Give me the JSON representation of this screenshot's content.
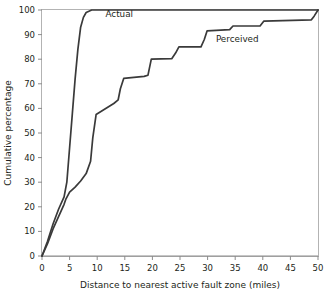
{
  "chart_data": {
    "type": "line",
    "title": "",
    "xlabel": "Distance to nearest active fault zone (miles)",
    "ylabel": "Cumulative percentage",
    "xlim": [
      0,
      50
    ],
    "ylim": [
      0,
      100
    ],
    "xticks": [
      0,
      5,
      10,
      15,
      20,
      25,
      30,
      35,
      40,
      45,
      50
    ],
    "yticks": [
      0,
      10,
      20,
      30,
      40,
      50,
      60,
      70,
      80,
      90,
      100
    ],
    "xtick_labels": [
      "0",
      "5",
      "10",
      "15",
      "20",
      "25",
      "30",
      "35",
      "40",
      "45",
      "50"
    ],
    "ytick_labels": [
      "0",
      "10",
      "20",
      "30",
      "40",
      "50",
      "60",
      "70",
      "80",
      "90",
      "100"
    ],
    "grid": false,
    "legend_position": "inline-annotations",
    "line_color": "#3a3a3a",
    "frame_color": "#b3b3b3",
    "series": [
      {
        "name": "Actual",
        "label_x": 11.5,
        "label_y": 97,
        "x": [
          0,
          1,
          2,
          3,
          4,
          4.5,
          5,
          5.5,
          6,
          6.5,
          7,
          7.5,
          8,
          9,
          12,
          20,
          30,
          40,
          50
        ],
        "values": [
          0,
          6,
          13,
          19,
          24,
          30,
          44,
          58,
          72,
          84,
          93,
          97,
          99,
          100,
          100,
          100,
          100,
          100,
          100
        ]
      },
      {
        "name": "Perceived",
        "label_x": 31.5,
        "label_y": 87,
        "x": [
          0,
          1,
          2,
          3,
          4,
          4.3,
          5,
          6,
          7,
          8,
          8.8,
          9.2,
          9.8,
          13,
          13.8,
          14.2,
          14.8,
          18.5,
          19.2,
          19.8,
          23.5,
          24.2,
          24.8,
          28.8,
          29.4,
          29.9,
          34,
          34.6,
          39.5,
          40.2,
          48.8,
          49.3,
          50
        ],
        "values": [
          0,
          5,
          11,
          16,
          21,
          23,
          26,
          28,
          30.5,
          33.5,
          38.5,
          48,
          57.5,
          62,
          63.5,
          68,
          72.2,
          73,
          73.5,
          80,
          80.2,
          82.5,
          85,
          85,
          88,
          91.5,
          92,
          93.5,
          93.5,
          95.5,
          96,
          97.5,
          100
        ]
      }
    ]
  },
  "annotations": {
    "actual_label": "Actual",
    "perceived_label": "Perceived"
  }
}
